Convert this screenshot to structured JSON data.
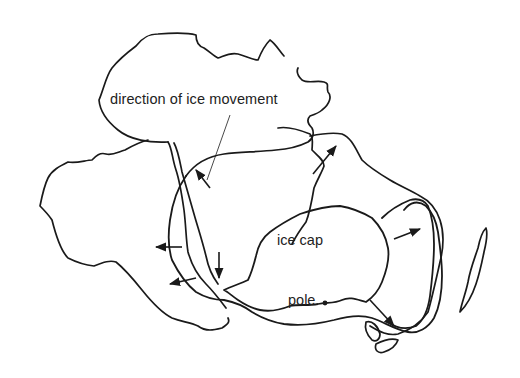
{
  "figure": {
    "type": "map-diagram",
    "colors": {
      "ink": "#1a1a1a",
      "background": "#ffffff"
    }
  },
  "labels": {
    "direction": "direction of ice movement",
    "ice_cap": "ice cap",
    "pole": "pole"
  },
  "arrows": [
    {
      "id": "arrow-nw",
      "direction": "north-west"
    },
    {
      "id": "arrow-ne",
      "direction": "north-east"
    },
    {
      "id": "arrow-w-upper",
      "direction": "west"
    },
    {
      "id": "arrow-w-lower",
      "direction": "west"
    },
    {
      "id": "arrow-s",
      "direction": "south"
    },
    {
      "id": "arrow-e",
      "direction": "east"
    },
    {
      "id": "arrow-se",
      "direction": "south-east"
    }
  ]
}
